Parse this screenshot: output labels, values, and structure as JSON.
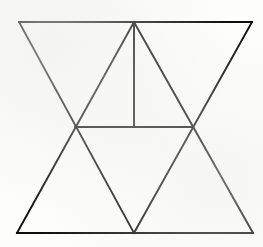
{
  "figure": {
    "canvas": {
      "width": 263,
      "height": 247,
      "background_color": "#fdfdfb"
    },
    "style": {
      "stroke_color": "#0d0d0d",
      "stroke_width": 1.9,
      "fill": "none"
    },
    "points": {
      "top_left": {
        "label": "top-left corner",
        "x": 19,
        "y": 22
      },
      "top_apex": {
        "label": "top apex",
        "x": 134,
        "y": 22
      },
      "top_right": {
        "label": "top-right corner",
        "x": 252,
        "y": 22
      },
      "left_cross": {
        "label": "left crossing point",
        "x": 75,
        "y": 127
      },
      "median_foot": {
        "label": "vertical median foot",
        "x": 134,
        "y": 127
      },
      "right_cross": {
        "label": "right crossing point",
        "x": 191,
        "y": 127
      },
      "bottom_left": {
        "label": "bottom-left corner",
        "x": 17,
        "y": 233
      },
      "bottom_apex": {
        "label": "bottom apex",
        "x": 134,
        "y": 233
      },
      "bottom_right": {
        "label": "bottom-right corner",
        "x": 253,
        "y": 233
      }
    },
    "segments": [
      {
        "name": "top-edge",
        "from": "top_left",
        "to": "top_right",
        "d": "M 19 22 L 252 22"
      },
      {
        "name": "bottom-edge",
        "from": "bottom_left",
        "to": "bottom_right",
        "d": "M 17 233 L 253 233"
      },
      {
        "name": "middle-horizontal",
        "from": "left_cross",
        "to": "right_cross",
        "d": "M 75 127 L 191 127"
      },
      {
        "name": "left-outer-diagonal",
        "from": "top_left",
        "to": "bottom_apex",
        "d": "M 19 22 L 134 233"
      },
      {
        "name": "right-outer-diagonal",
        "from": "top_right",
        "to": "bottom_apex",
        "d": "M 252 22 L 134 233"
      },
      {
        "name": "left-inner-diagonal",
        "from": "bottom_left",
        "to": "top_apex",
        "d": "M 17 233 L 134 22"
      },
      {
        "name": "right-inner-diagonal",
        "from": "bottom_right",
        "to": "top_apex",
        "d": "M 253 233 L 134 22"
      },
      {
        "name": "vertical-median",
        "from": "top_apex",
        "to": "median_foot",
        "d": "M 134 22 L 134 127"
      }
    ]
  }
}
